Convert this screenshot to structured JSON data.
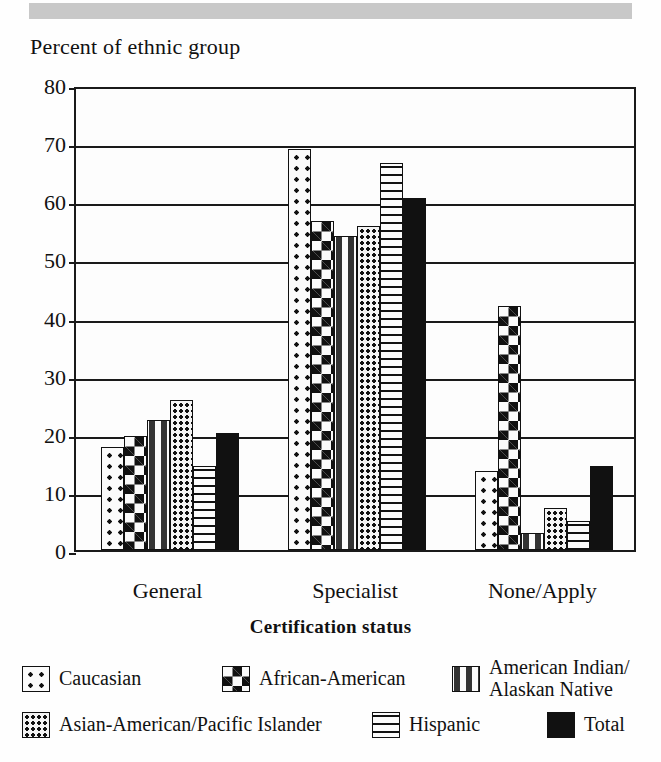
{
  "chart_data": {
    "type": "bar",
    "title": "Percent of ethnic group",
    "xlabel": "Certification status",
    "ylabel": "Percent of ethnic group",
    "ylim": [
      0,
      80
    ],
    "ytick_labels": [
      "80",
      "70",
      "60",
      "50",
      "40",
      "30",
      "20",
      "10",
      "0"
    ],
    "ytick_values": [
      80,
      70,
      60,
      50,
      40,
      30,
      20,
      10,
      0
    ],
    "grid": true,
    "legend_position": "bottom",
    "categories": [
      "General",
      "Specialist",
      "None/Apply"
    ],
    "series": [
      {
        "name": "Caucasian",
        "pattern": "large-dots",
        "values": [
          17.8,
          69.0,
          13.6
        ]
      },
      {
        "name": "African-American",
        "pattern": "checkerboard",
        "values": [
          19.6,
          56.6,
          42.0
        ]
      },
      {
        "name": "American Indian/\nAlaskan Native",
        "pattern": "dashes",
        "values": [
          22.4,
          54.0,
          3.0
        ]
      },
      {
        "name": "Asian-American/Pacific Islander",
        "pattern": "small-dots",
        "values": [
          25.8,
          55.7,
          7.3
        ]
      },
      {
        "name": "Hispanic",
        "pattern": "horizontal-lines",
        "values": [
          14.4,
          66.6,
          5.0
        ]
      },
      {
        "name": "Total",
        "pattern": "solid-black",
        "values": [
          20.2,
          60.5,
          14.4
        ]
      }
    ]
  },
  "legend": {
    "row1": [
      {
        "label": "Caucasian",
        "label_line2": ""
      },
      {
        "label": "African-American",
        "label_line2": ""
      },
      {
        "label": "American Indian/",
        "label_line2": "Alaskan Native"
      }
    ],
    "row2": [
      {
        "label": "Asian-American/Pacific Islander",
        "label_line2": ""
      },
      {
        "label": "Hispanic",
        "label_line2": ""
      },
      {
        "label": "Total",
        "label_line2": ""
      }
    ]
  },
  "colors": {
    "ink": "#111111",
    "paper": "#fefefe",
    "band": "#c8c8c8"
  }
}
